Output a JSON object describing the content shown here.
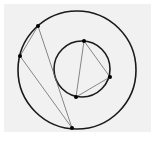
{
  "diagram": {
    "background": "#f1f1f1",
    "outer_circle": {
      "cx": 77,
      "cy": 70,
      "r": 59
    },
    "inner_circle": {
      "cx": 82,
      "cy": 69,
      "r": 28
    },
    "outer_points": [
      [
        38,
        26
      ],
      [
        20,
        56
      ],
      [
        72,
        128
      ]
    ],
    "inner_points": [
      [
        84,
        41
      ],
      [
        110,
        77
      ],
      [
        76,
        97
      ]
    ],
    "caption": ""
  }
}
